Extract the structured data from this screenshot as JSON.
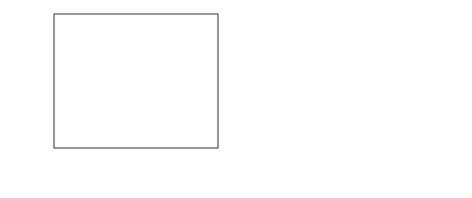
{
  "figure": {
    "background": "#ffffff",
    "marker_color": "#111111",
    "curve_color": "#111111",
    "axis_color": "#1a1a1a"
  },
  "chart_data": [
    {
      "type": "scatter",
      "panel": "(a)",
      "title": "",
      "xlabel": "Q/D",
      "ylabel": "p− / ρa gH",
      "ylabel_numerator": "p−",
      "ylabel_denominator_rho": "ρ",
      "ylabel_denominator_sub": "a",
      "ylabel_denominator_rest": "gH",
      "xlim": [
        0.0025,
        0.0355
      ],
      "ylim": [
        -0.52,
        0.055
      ],
      "xticks": [
        0.01,
        0.02,
        0.03
      ],
      "xtick_labels": [
        "0.01",
        "0.02",
        "0.03"
      ],
      "yticks": [
        0.0,
        -0.2,
        -0.4
      ],
      "ytick_labels": [
        "0.0",
        "-0.2",
        "-0.4"
      ],
      "x_minor_ticks": [
        0.005,
        0.015,
        0.025,
        0.035
      ],
      "y_minor_ticks": [
        -0.1,
        -0.3,
        -0.5
      ],
      "grid": false,
      "legend": "none",
      "x": [
        0.0042,
        0.0088,
        0.0139,
        0.0181,
        0.0228,
        0.0271,
        0.0321
      ],
      "values": [
        -0.011,
        -0.028,
        -0.068,
        -0.084,
        -0.221,
        -0.33,
        -0.481
      ],
      "fit_curve": {
        "x": [
          0.0035,
          0.006,
          0.009,
          0.012,
          0.015,
          0.018,
          0.021,
          0.024,
          0.027,
          0.03,
          0.0325
        ],
        "y": [
          -0.006,
          -0.01,
          -0.026,
          -0.05,
          -0.082,
          -0.122,
          -0.17,
          -0.226,
          -0.29,
          -0.38,
          -0.478
        ]
      }
    },
    {
      "type": "scatter",
      "panel": "(b)",
      "title": "",
      "xlabel": "Q/D",
      "ylabel": "p+ / ρa gH",
      "ylabel_numerator": "p+",
      "ylabel_denominator_rho": "ρ",
      "ylabel_denominator_sub": "a",
      "ylabel_denominator_rest": "gH",
      "xlim": [
        0.0025,
        0.0355
      ],
      "ylim": [
        -0.018,
        0.207
      ],
      "xticks": [
        0.01,
        0.02,
        0.03
      ],
      "xtick_labels": [
        "0.01",
        "0.02",
        "0.03"
      ],
      "yticks": [
        0.0,
        0.05,
        0.1,
        0.15,
        0.2
      ],
      "ytick_labels": [
        "0.00",
        "0.05",
        "0.10",
        "0.15",
        "0.20"
      ],
      "x_minor_ticks": [
        0.005,
        0.015,
        0.025,
        0.035
      ],
      "y_minor_ticks": [
        0.025,
        0.075,
        0.125,
        0.175
      ],
      "grid": false,
      "legend": "none",
      "x": [
        0.0042,
        0.0088,
        0.0139,
        0.0181,
        0.0228,
        0.0271,
        0.0321
      ],
      "values": [
        0.016,
        0.02,
        0.031,
        0.046,
        0.069,
        0.113,
        0.185
      ],
      "fit_curve": {
        "x": [
          0.0038,
          0.006,
          0.009,
          0.012,
          0.015,
          0.018,
          0.021,
          0.024,
          0.027,
          0.03,
          0.0325
        ],
        "y": [
          0.002,
          0.006,
          0.012,
          0.019,
          0.029,
          0.042,
          0.059,
          0.082,
          0.112,
          0.15,
          0.184
        ]
      }
    }
  ]
}
